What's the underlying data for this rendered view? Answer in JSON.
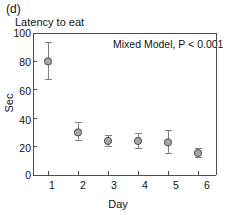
{
  "figure": {
    "panel_label": "(d)",
    "title": "Latency to eat",
    "annotation": "Mixed Model, P < 0.001",
    "background_color": "#ffffff",
    "axis_color": "#4d4d4d",
    "marker_fill_color": "#a6a6a6",
    "marker_edge_color": "#4d4d4d",
    "errorbar_color": "#808080"
  },
  "chart_data": {
    "type": "scatter",
    "title": "Latency to eat",
    "xlabel": "Day",
    "ylabel": "Sec",
    "x": [
      1,
      2,
      3,
      4,
      5,
      6
    ],
    "categories": [
      "1",
      "2",
      "3",
      "4",
      "5",
      "6"
    ],
    "values": [
      80,
      30,
      24,
      24,
      23,
      15.5
    ],
    "error_low": [
      67,
      24,
      20,
      19,
      15,
      12
    ],
    "error_high": [
      93,
      37,
      28,
      29,
      31,
      19
    ],
    "xlim": [
      0.5,
      6.6
    ],
    "ylim": [
      0,
      100
    ],
    "yticks": [
      0,
      20,
      40,
      60,
      80,
      100
    ],
    "ytick_labels": [
      "0",
      "20",
      "40",
      "60",
      "80",
      "100"
    ],
    "xticks": [
      1,
      2,
      3,
      4,
      5,
      6
    ],
    "xtick_labels": [
      "1",
      "2",
      "3",
      "4",
      "5",
      "6"
    ],
    "grid": false,
    "legend": null,
    "annotations": [
      "Mixed Model, P < 0.001"
    ],
    "error_type": "95% CI"
  }
}
